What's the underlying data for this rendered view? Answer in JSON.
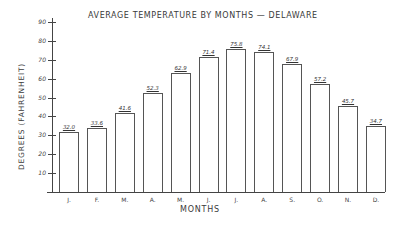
{
  "chart_data": {
    "type": "bar",
    "title": "AVERAGE TEMPERATURE BY MONTHS — DELAWARE",
    "xlabel": "MONTHS",
    "ylabel": "DEGREES (FAHRENHEIT)",
    "categories": [
      "J.",
      "F.",
      "M.",
      "A.",
      "M.",
      "J.",
      "J.",
      "A.",
      "S.",
      "O.",
      "N.",
      "D."
    ],
    "values": [
      32.0,
      33.6,
      41.6,
      52.3,
      62.9,
      71.4,
      75.8,
      74.1,
      67.9,
      57.2,
      45.7,
      34.7
    ],
    "value_labels": [
      "32.0",
      "33.6",
      "41.6",
      "52.3",
      "62.9",
      "71.4",
      "75.8",
      "74.1",
      "67.9",
      "57.2",
      "45.7",
      "34.7"
    ],
    "yticks": [
      10,
      20,
      30,
      40,
      50,
      60,
      70,
      80,
      90
    ],
    "ylim": [
      0,
      90
    ],
    "grid": false,
    "legend": null
  }
}
